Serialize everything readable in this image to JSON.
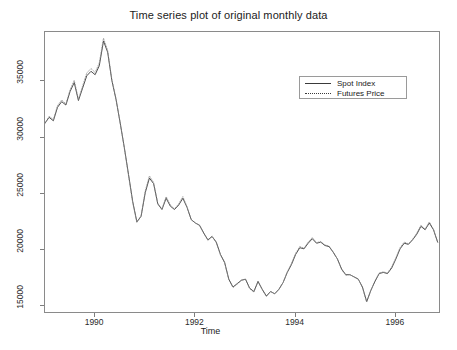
{
  "chart_data": {
    "type": "line",
    "title": "Time series plot of original monthly data",
    "xlabel": "Time",
    "ylabel": "",
    "xlim": [
      1989.0,
      1996.9
    ],
    "ylim": [
      14300,
      39400
    ],
    "grid": false,
    "legend_position": "upper right",
    "xticks": [
      1990,
      1992,
      1994,
      1996
    ],
    "xtick_labels": [
      "1990",
      "1992",
      "1994",
      "1996"
    ],
    "yticks": [
      15000,
      20000,
      25000,
      30000,
      35000
    ],
    "ytick_labels": [
      "15000",
      "20000",
      "25000",
      "30000",
      "35000"
    ],
    "x": [
      1989.0,
      1989.083,
      1989.167,
      1989.25,
      1989.333,
      1989.417,
      1989.5,
      1989.583,
      1989.667,
      1989.75,
      1989.833,
      1989.917,
      1990.0,
      1990.083,
      1990.167,
      1990.25,
      1990.333,
      1990.417,
      1990.5,
      1990.583,
      1990.667,
      1990.75,
      1990.833,
      1990.917,
      1991.0,
      1991.083,
      1991.167,
      1991.25,
      1991.333,
      1991.417,
      1991.5,
      1991.583,
      1991.667,
      1991.75,
      1991.833,
      1991.917,
      1992.0,
      1992.083,
      1992.167,
      1992.25,
      1992.333,
      1992.417,
      1992.5,
      1992.583,
      1992.667,
      1992.75,
      1992.833,
      1992.917,
      1993.0,
      1993.083,
      1993.167,
      1993.25,
      1993.333,
      1993.417,
      1993.5,
      1993.583,
      1993.667,
      1993.75,
      1993.833,
      1993.917,
      1994.0,
      1994.083,
      1994.167,
      1994.25,
      1994.333,
      1994.417,
      1994.5,
      1994.583,
      1994.667,
      1994.75,
      1994.833,
      1994.917,
      1995.0,
      1995.083,
      1995.167,
      1995.25,
      1995.333,
      1995.417,
      1995.5,
      1995.583,
      1995.667,
      1995.75,
      1995.833,
      1995.917,
      1996.0,
      1996.083,
      1996.167,
      1996.25,
      1996.333,
      1996.417,
      1996.5,
      1996.583,
      1996.667,
      1996.75,
      1996.833
    ],
    "series": [
      {
        "name": "Spot Index",
        "style": "solid",
        "color": "#3a3a3a",
        "values": [
          31300,
          31800,
          31500,
          32700,
          33200,
          32900,
          34100,
          34900,
          33300,
          34400,
          35500,
          35900,
          35600,
          36400,
          38600,
          37600,
          35100,
          33400,
          31300,
          29100,
          26700,
          24300,
          22500,
          23000,
          25100,
          26400,
          25900,
          24100,
          23600,
          24600,
          23900,
          23600,
          24000,
          24600,
          23800,
          22700,
          22400,
          22200,
          21500,
          20900,
          21200,
          20700,
          19600,
          18900,
          17400,
          16700,
          17000,
          17300,
          17400,
          16600,
          16300,
          17200,
          16500,
          15900,
          16300,
          16100,
          16500,
          17100,
          18000,
          18700,
          19600,
          20200,
          20100,
          20600,
          21000,
          20600,
          20700,
          20400,
          20300,
          19800,
          19200,
          18300,
          17800,
          17800,
          17600,
          17400,
          16700,
          15400,
          16400,
          17200,
          17900,
          18000,
          17900,
          18400,
          19200,
          20100,
          20600,
          20500,
          20900,
          21400,
          22100,
          21800,
          22400,
          21800,
          20700
        ]
      },
      {
        "name": "Futures Price",
        "style": "dotted",
        "color": "#8c8c8c",
        "values": [
          31250,
          31900,
          31600,
          32850,
          33350,
          33000,
          34250,
          35100,
          33400,
          34600,
          35750,
          36150,
          35800,
          36650,
          38850,
          37750,
          35200,
          33450,
          31300,
          29050,
          26600,
          24200,
          22450,
          23000,
          25250,
          26600,
          26000,
          24150,
          23650,
          24750,
          24000,
          23650,
          24100,
          24750,
          23850,
          22700,
          22400,
          22200,
          21500,
          20850,
          21200,
          20650,
          19550,
          18850,
          17350,
          16650,
          16950,
          17300,
          17400,
          16550,
          16250,
          17200,
          16450,
          15850,
          16300,
          16100,
          16500,
          17100,
          18050,
          18800,
          19700,
          20300,
          20150,
          20700,
          21100,
          20650,
          20750,
          20450,
          20350,
          19800,
          19200,
          18250,
          17750,
          17800,
          17600,
          17400,
          16650,
          15350,
          16400,
          17250,
          17950,
          18050,
          17950,
          18500,
          19300,
          20200,
          20700,
          20550,
          20950,
          21500,
          22200,
          21850,
          22500,
          21850,
          20700
        ]
      }
    ]
  },
  "legend": {
    "items": [
      {
        "label": "Spot Index"
      },
      {
        "label": "Futures Price"
      }
    ]
  }
}
